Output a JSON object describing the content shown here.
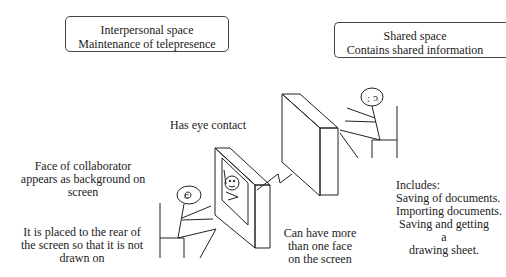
{
  "boxes": {
    "interpersonal": {
      "line1": "Interpersonal space",
      "line2": "Maintenance of telepresence"
    },
    "shared": {
      "line1": "Shared space",
      "line2": "Contains shared information"
    }
  },
  "labels": {
    "eye_contact": "Has eye contact",
    "face_background": [
      "Face of collaborator",
      "appears as background on",
      "screen"
    ],
    "rear_placement": [
      "It is placed to the rear of",
      "the screen so that it is not",
      "drawn on"
    ],
    "multiple_faces": [
      "Can have more",
      "than one face",
      "on the screen"
    ],
    "includes": [
      "Includes:",
      "Saving of documents.",
      "Importing documents.",
      "Saving and getting a",
      "drawing sheet."
    ]
  }
}
